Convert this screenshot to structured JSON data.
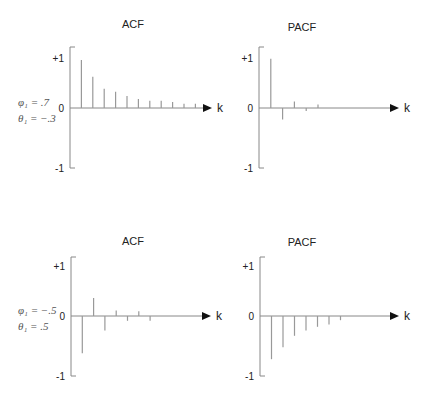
{
  "chart_data": [
    {
      "type": "bar",
      "title": "ACF",
      "xlabel": "k",
      "ylabel": "",
      "ylim": [
        -1,
        1
      ],
      "yticks": [
        "+1",
        "0",
        "-1"
      ],
      "params": {
        "phi": "φ₁ = .7",
        "theta": "θ₁ = −.3"
      },
      "lags": [
        1,
        2,
        3,
        4,
        5,
        6,
        7,
        8,
        9,
        10,
        11
      ],
      "values": [
        0.8,
        0.52,
        0.32,
        0.27,
        0.2,
        0.15,
        0.12,
        0.12,
        0.1,
        0.07,
        0.07
      ],
      "layout": {
        "ox": 70,
        "oy": 108,
        "top": 47,
        "bottom": 168,
        "scale": 60,
        "arrow_x": 212,
        "dx": 11.4,
        "title_x": 133,
        "title_y": 28
      }
    },
    {
      "type": "bar",
      "title": "PACF",
      "xlabel": "k",
      "ylabel": "",
      "ylim": [
        -1,
        1
      ],
      "yticks": [
        "+1",
        "0",
        "-1"
      ],
      "lags": [
        1,
        2,
        3,
        4,
        5
      ],
      "values": [
        0.82,
        -0.19,
        0.11,
        -0.05,
        0.06
      ],
      "layout": {
        "ox": 259,
        "oy": 108,
        "top": 47,
        "bottom": 168,
        "scale": 60,
        "arrow_x": 399,
        "dx": 11.8,
        "title_x": 302,
        "title_y": 31
      }
    },
    {
      "type": "bar",
      "title": "ACF",
      "xlabel": "k",
      "ylabel": "",
      "ylim": [
        -1,
        1
      ],
      "yticks": [
        "+1",
        "0",
        "-1"
      ],
      "params": {
        "phi": "φ₁ = −.5",
        "theta": "θ₁ = .5"
      },
      "lags": [
        1,
        2,
        3,
        4,
        5,
        6,
        7
      ],
      "values": [
        -0.62,
        0.3,
        -0.24,
        0.09,
        -0.08,
        0.08,
        -0.08
      ],
      "layout": {
        "ox": 71,
        "oy": 316,
        "top": 257,
        "bottom": 376,
        "scale": 60,
        "arrow_x": 211,
        "dx": 11.3,
        "title_x": 133,
        "title_y": 245
      }
    },
    {
      "type": "bar",
      "title": "PACF",
      "xlabel": "k",
      "ylabel": "",
      "ylim": [
        -1,
        1
      ],
      "yticks": [
        "+1",
        "0",
        "-1"
      ],
      "lags": [
        1,
        2,
        3,
        4,
        5,
        6,
        7
      ],
      "values": [
        -0.72,
        -0.52,
        -0.33,
        -0.24,
        -0.18,
        -0.14,
        -0.07
      ],
      "layout": {
        "ox": 260,
        "oy": 316,
        "top": 257,
        "bottom": 376,
        "scale": 60,
        "arrow_x": 399,
        "dx": 11.5,
        "title_x": 302,
        "title_y": 246
      }
    }
  ],
  "colors": {
    "axis": "#888888",
    "spike": "#999999",
    "text": "#222222",
    "arrow": "#111111"
  }
}
